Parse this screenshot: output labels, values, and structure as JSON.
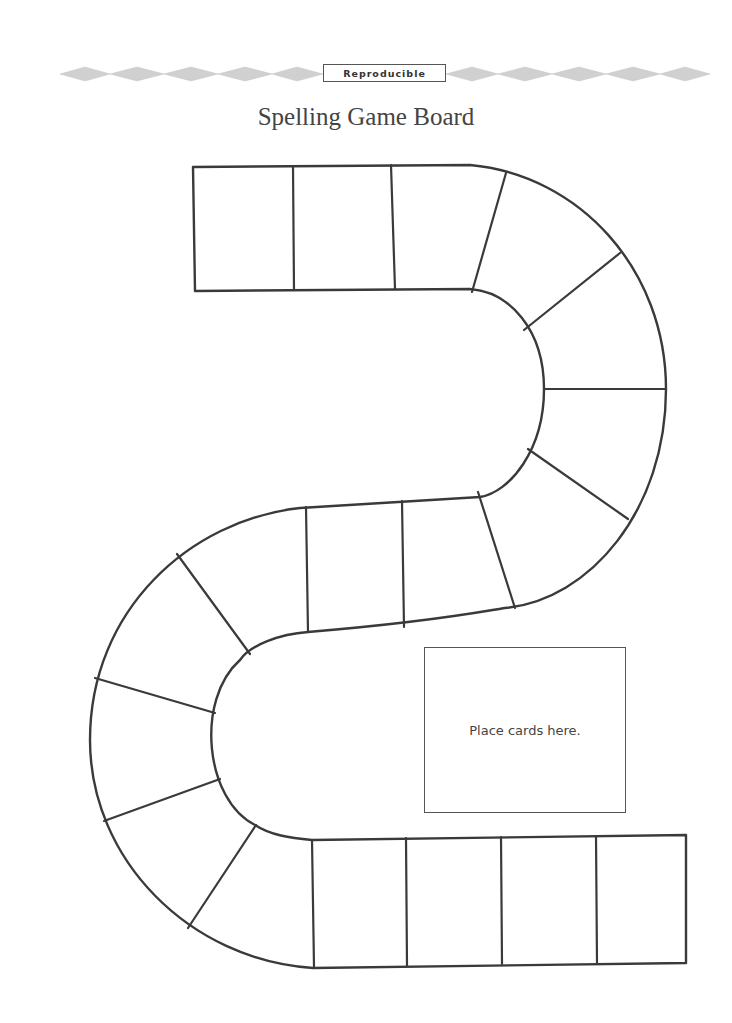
{
  "header": {
    "badge_label": "Reproducible",
    "title": "Spelling Game Board"
  },
  "board": {
    "space_count": 26,
    "segments": [
      {
        "name": "top-straight",
        "spaces": 3
      },
      {
        "name": "upper-right-curve",
        "spaces": 6
      },
      {
        "name": "middle-straight",
        "spaces": 2
      },
      {
        "name": "lower-left-curve",
        "spaces": 6
      },
      {
        "name": "bottom-straight",
        "spaces": 4
      }
    ],
    "card_area_label": "Place cards here."
  },
  "colors": {
    "line": "#3a3a3a",
    "banner_diamond": "#cfcfcf",
    "text": "#444444"
  }
}
